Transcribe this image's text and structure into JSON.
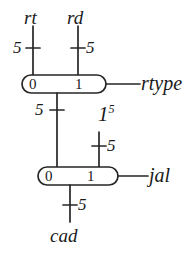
{
  "diagram": {
    "stroke_color": "#262626",
    "background_color": "#ffffff",
    "inputs": [
      {
        "name": "rt",
        "width": "5"
      },
      {
        "name": "rd",
        "width": "5"
      }
    ],
    "constant": {
      "value": "1",
      "width": "5"
    },
    "mux_top": {
      "port0": "0",
      "port1": "1",
      "select": "rtype",
      "output_width": "5"
    },
    "mux_bottom": {
      "port0": "0",
      "port1": "1",
      "select": "jal",
      "input1_width": "5",
      "output_width": "5"
    },
    "output": {
      "name": "cad",
      "width": "5"
    }
  }
}
